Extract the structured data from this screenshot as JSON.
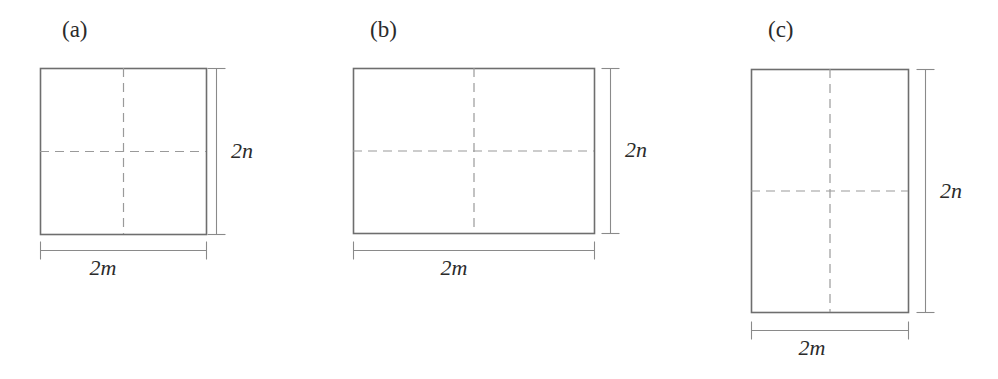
{
  "figure": {
    "background_color": "#ffffff",
    "solid_line_color": "#6e6e6e",
    "dashed_line_color": "#9a9a9a",
    "dimension_line_color": "#8a8a8a",
    "text_color": "#2b2b2b",
    "panels": [
      {
        "id": "a",
        "label": "(a)",
        "label_x": 62,
        "label_y": 18,
        "rect": {
          "x": 40,
          "y": 68,
          "width": 166,
          "height": 166
        },
        "width_label": "2m",
        "height_label": "2n",
        "width_dim_y": 250,
        "width_label_x": 103,
        "width_label_y": 257,
        "height_dim_x": 216,
        "height_label_x": 231,
        "height_label_y": 140,
        "dashed_midlines": true
      },
      {
        "id": "b",
        "label": "(b)",
        "label_x": 370,
        "label_y": 18,
        "rect": {
          "x": 353,
          "y": 68,
          "width": 241,
          "height": 165
        },
        "width_label": "2m",
        "height_label": "2n",
        "width_dim_y": 250,
        "width_label_x": 454,
        "width_label_y": 257,
        "height_dim_x": 610,
        "height_label_x": 625,
        "height_label_y": 139,
        "dashed_midlines": true
      },
      {
        "id": "c",
        "label": "(c)",
        "label_x": 768,
        "label_y": 18,
        "rect": {
          "x": 751,
          "y": 69,
          "width": 157,
          "height": 243
        },
        "width_label": "2m",
        "height_label": "2n",
        "width_dim_y": 330,
        "width_label_x": 812,
        "width_label_y": 337,
        "height_dim_x": 925,
        "height_label_x": 940,
        "height_label_y": 180,
        "dashed_midlines": true
      }
    ]
  },
  "chart_data": {
    "type": "diagram",
    "title": "",
    "panels": [
      {
        "label": "(a)",
        "shape": "square",
        "width_label": "2m",
        "height_label": "2n",
        "aspect_ratio_w_h": 1.0,
        "quadrants": 4
      },
      {
        "label": "(b)",
        "shape": "wide rectangle",
        "width_label": "2m",
        "height_label": "2n",
        "aspect_ratio_w_h": 1.46,
        "quadrants": 4
      },
      {
        "label": "(c)",
        "shape": "tall rectangle",
        "width_label": "2m",
        "height_label": "2n",
        "aspect_ratio_w_h": 0.65,
        "quadrants": 4
      }
    ]
  }
}
